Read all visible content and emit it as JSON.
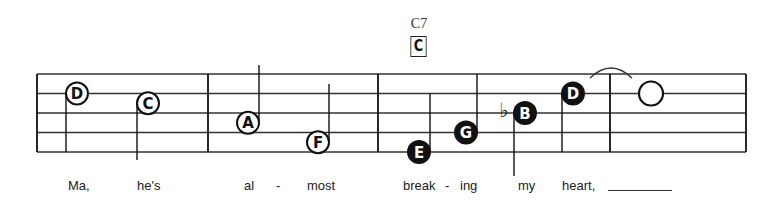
{
  "chord": {
    "name": "C7",
    "box_label": "C"
  },
  "notes": [
    {
      "letter": "D",
      "style": "open",
      "pitch_step": 3
    },
    {
      "letter": "C",
      "style": "open",
      "pitch_step": 2.5
    },
    {
      "letter": "A",
      "style": "open",
      "pitch_step": 1.5
    },
    {
      "letter": "F",
      "style": "open",
      "pitch_step": 0.5
    },
    {
      "letter": "E",
      "style": "filled",
      "pitch_step": 0
    },
    {
      "letter": "G",
      "style": "filled",
      "pitch_step": 1
    },
    {
      "letter": "B",
      "style": "filled",
      "pitch_step": 2,
      "accidental": "♭"
    },
    {
      "letter": "D",
      "style": "filled",
      "pitch_step": 3
    },
    {
      "letter": "",
      "style": "whole",
      "pitch_step": 3
    }
  ],
  "lyrics": [
    "Ma,",
    "he's",
    "al",
    "-",
    "most",
    "break",
    "-",
    "ing",
    "my",
    "heart,"
  ],
  "colors": {
    "ink": "#111111",
    "staff": "#333333"
  }
}
